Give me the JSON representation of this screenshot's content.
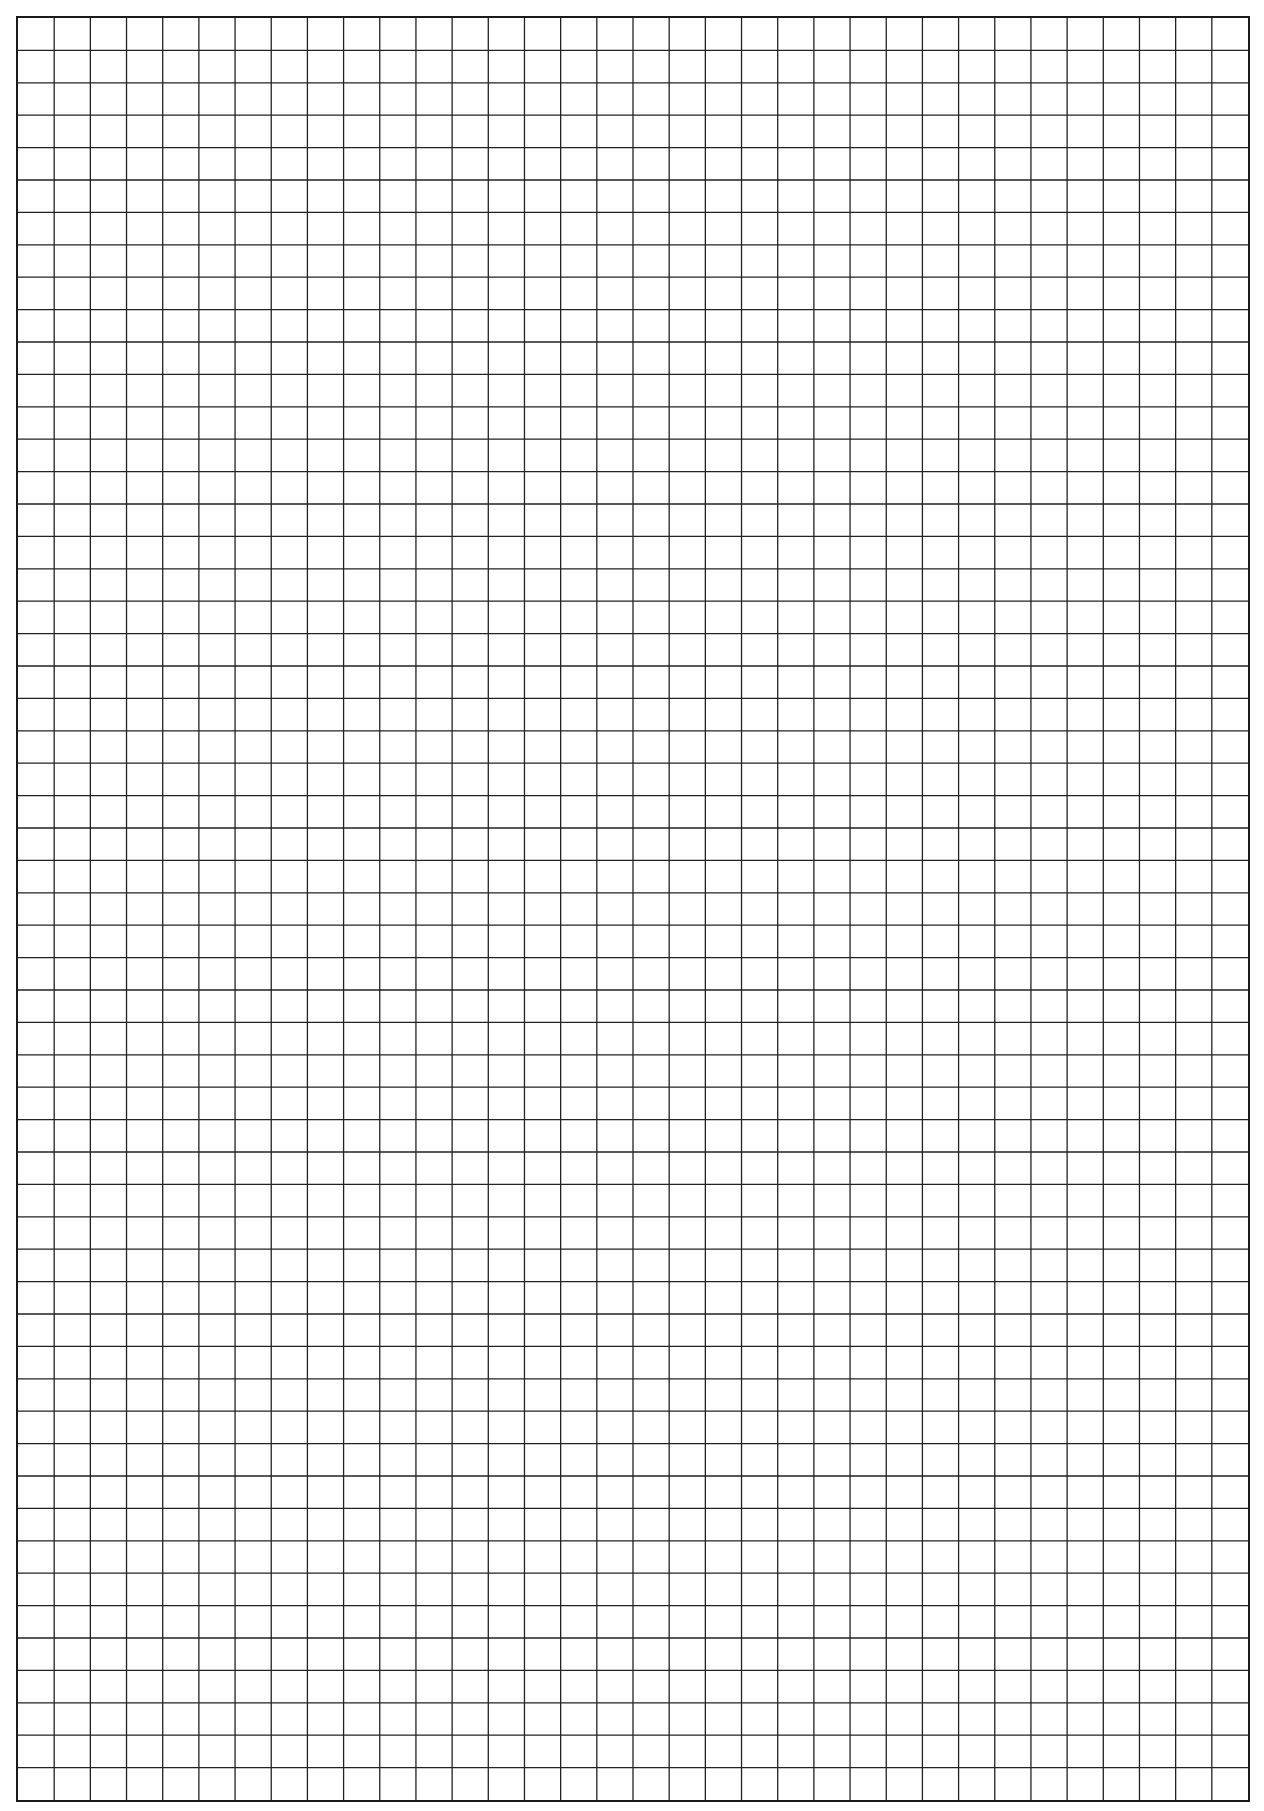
{
  "page": {
    "type": "graph-paper",
    "background_color": "#ffffff",
    "line_color": "#222222",
    "border_color": "#1a1a1a"
  },
  "grid": {
    "columns": 34,
    "rows": 55,
    "cell_width_px": 36.3,
    "cell_height_px": 32.4
  }
}
